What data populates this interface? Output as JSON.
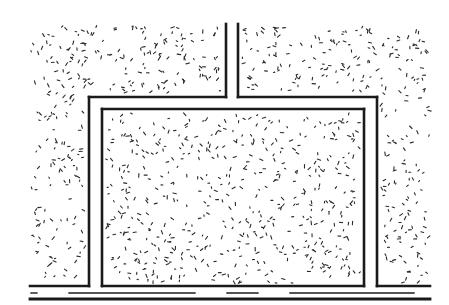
{
  "diagram": {
    "type": "technical-drawing",
    "colors": {
      "line": "#1a1a1a",
      "speckle": "#2a2a2a",
      "background": "#ffffff"
    },
    "labels": []
  }
}
